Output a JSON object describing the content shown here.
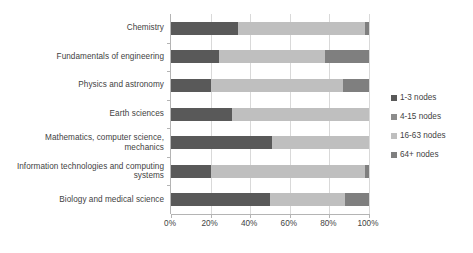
{
  "chart_data": {
    "type": "bar",
    "orientation": "horizontal",
    "stacked": true,
    "normalized_percent": true,
    "title": "",
    "subtitle": "",
    "xlabel": "",
    "ylabel": "",
    "xlim": [
      0,
      100
    ],
    "x_tick_labels": [
      "0%",
      "20%",
      "40%",
      "60%",
      "80%",
      "100%"
    ],
    "x_tick_values": [
      0,
      20,
      40,
      60,
      80,
      100
    ],
    "grid": "vertical",
    "legend_position": "right",
    "categories": [
      "Chemistry",
      "Fundamentals of engineering",
      "Physics and astronomy",
      "Earth sciences",
      "Mathematics, computer science, mechanics",
      "Information technologies and computing systems",
      "Biology and medical science"
    ],
    "series": [
      {
        "name": "1-3 nodes",
        "color": "#595959",
        "values": [
          34,
          24,
          20,
          31,
          51,
          20,
          50
        ]
      },
      {
        "name": "4-15 nodes",
        "color": "#8c8c8c",
        "values": [
          0,
          0,
          0,
          0,
          0,
          0,
          0
        ]
      },
      {
        "name": "16-63 nodes",
        "color": "#bfbfbf",
        "values": [
          64,
          54,
          67,
          69,
          49,
          78,
          38
        ]
      },
      {
        "name": "64+ nodes",
        "color": "#7f7f7f",
        "values": [
          2,
          22,
          13,
          0,
          0,
          2,
          12
        ]
      }
    ]
  },
  "legend": {
    "items": [
      {
        "label": "1-3 nodes",
        "color": "#595959"
      },
      {
        "label": "4-15 nodes",
        "color": "#8c8c8c"
      },
      {
        "label": "16-63 nodes",
        "color": "#bfbfbf"
      },
      {
        "label": "64+ nodes",
        "color": "#7f7f7f"
      }
    ]
  },
  "axis": {
    "x_labels": [
      "0%",
      "20%",
      "40%",
      "60%",
      "80%",
      "100%"
    ],
    "y_labels": [
      "Chemistry",
      "Fundamentals of engineering",
      "Physics and astronomy",
      "Earth sciences",
      "Mathematics, computer science, mechanics",
      "Information technologies and computing systems",
      "Biology and medical science"
    ]
  },
  "style": {
    "axis_line_color": "#b4b4b4",
    "gridline_color": "#d9d9d9",
    "text_color": "#3f3f3f",
    "background": "#ffffff"
  }
}
